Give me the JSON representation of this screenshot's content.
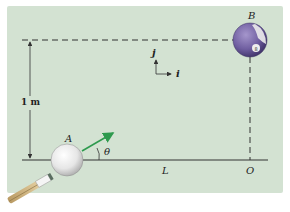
{
  "diagram": {
    "labels": {
      "ball_a": "A",
      "ball_b": "B",
      "angle": "θ",
      "horizontal_distance": "L",
      "origin": "O",
      "vertical_distance": "1 m",
      "unit_vector_j": "j",
      "unit_vector_i": "i"
    },
    "colors": {
      "table": "#d3e2d2",
      "velocity_arrow": "#2e9a4e",
      "ball_b": "#7b68a8",
      "ball_a": "#f2f2f2",
      "line": "#333333"
    }
  }
}
